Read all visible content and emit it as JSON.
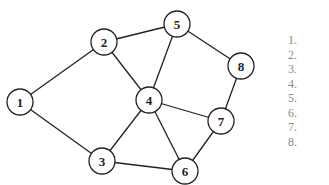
{
  "title": {
    "text": "",
    "clipped": true
  },
  "graph": {
    "nodes": [
      {
        "id": "1",
        "label": "1",
        "x": 20,
        "y": 102
      },
      {
        "id": "2",
        "label": "2",
        "x": 104,
        "y": 42
      },
      {
        "id": "3",
        "label": "3",
        "x": 102,
        "y": 161
      },
      {
        "id": "4",
        "label": "4",
        "x": 149,
        "y": 100
      },
      {
        "id": "5",
        "label": "5",
        "x": 177,
        "y": 24
      },
      {
        "id": "6",
        "label": "6",
        "x": 185,
        "y": 171
      },
      {
        "id": "7",
        "label": "7",
        "x": 221,
        "y": 121
      },
      {
        "id": "8",
        "label": "8",
        "x": 241,
        "y": 66
      }
    ],
    "edges": [
      [
        "1",
        "2"
      ],
      [
        "1",
        "3"
      ],
      [
        "2",
        "5"
      ],
      [
        "2",
        "4"
      ],
      [
        "4",
        "5"
      ],
      [
        "5",
        "8"
      ],
      [
        "8",
        "7"
      ],
      [
        "4",
        "7"
      ],
      [
        "4",
        "3"
      ],
      [
        "4",
        "6"
      ],
      [
        "3",
        "6"
      ],
      [
        "6",
        "7"
      ]
    ],
    "node_radius": 13,
    "stroke_color": "#222222",
    "fill_color": "#ffffff"
  },
  "list": {
    "items": [
      "1.",
      "2.",
      "3.",
      "4.",
      "5.",
      "6.",
      "7.",
      "8."
    ],
    "color": "#8a8a8a"
  }
}
